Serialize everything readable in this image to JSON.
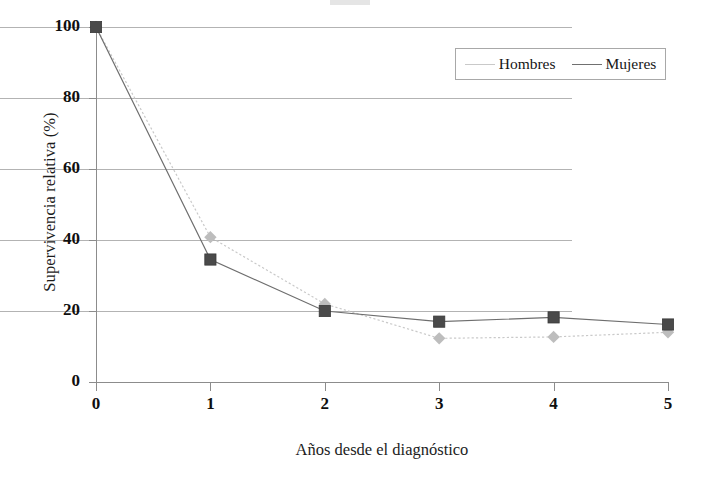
{
  "chart_data": {
    "type": "line",
    "title": "",
    "xlabel": "Años desde el diagnóstico",
    "ylabel": "Supervivencia relativa (%)",
    "x": [
      0,
      1,
      2,
      3,
      4,
      5
    ],
    "xticklabels": [
      "0",
      "1",
      "2",
      "3",
      "4",
      "5"
    ],
    "yticklabels": [
      "0",
      "20",
      "40",
      "60",
      "80",
      "100"
    ],
    "yticks": [
      0,
      20,
      40,
      60,
      80,
      100
    ],
    "xlim": [
      0,
      5
    ],
    "ylim": [
      0,
      100
    ],
    "grid": "horizontal",
    "legend_position": "top-right",
    "series": [
      {
        "name": "Hombres",
        "values": [
          100,
          40.8,
          22.0,
          12.3,
          12.7,
          14.0
        ],
        "color": "#bdbdbd",
        "marker": "diamond",
        "linestyle": "dotted"
      },
      {
        "name": "Mujeres",
        "values": [
          100,
          34.5,
          20.0,
          17.0,
          18.2,
          16.2
        ],
        "color": "#4a4a4a",
        "marker": "square",
        "linestyle": "solid"
      }
    ]
  },
  "legend": {
    "items": [
      {
        "label": "Hombres"
      },
      {
        "label": "Mujeres"
      }
    ]
  },
  "axes": {
    "y_title": "Supervivencia relativa (%)",
    "x_title": "Años desde el diagnóstico"
  },
  "colors": {
    "series_hombres": "#bdbdbd",
    "series_mujeres": "#4a4a4a",
    "gridline": "#b3b3b3",
    "axis": "#8c8c8c",
    "text": "#1a1a1a",
    "background": "#ffffff"
  }
}
